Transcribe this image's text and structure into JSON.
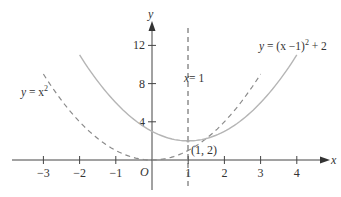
{
  "chart_data": {
    "type": "line",
    "title": "",
    "xlabel": "x",
    "ylabel": "y",
    "xlim": [
      -3.6,
      4.9
    ],
    "ylim": [
      -3,
      16
    ],
    "grid": false,
    "origin_label": "O",
    "x_ticks": [
      -3,
      -2,
      -1,
      1,
      2,
      3,
      4
    ],
    "x_tick_labels": [
      "−3",
      "−2",
      "−1",
      "1",
      "2",
      "3",
      "4"
    ],
    "y_ticks": [
      4,
      8,
      12
    ],
    "y_tick_labels": [
      "4",
      "8",
      "12"
    ],
    "series": [
      {
        "name": "y = x²",
        "style": "dashed",
        "color": "#8a8a8a",
        "x": [
          -3,
          -2,
          -1,
          0,
          1,
          2,
          3
        ],
        "y": [
          9,
          4,
          1,
          0,
          1,
          4,
          9
        ]
      },
      {
        "name": "y = (x − 1)² + 2",
        "style": "solid",
        "color": "#b5b5b5",
        "x": [
          -2,
          -1,
          0,
          1,
          2,
          3,
          4
        ],
        "y": [
          11,
          6,
          3,
          2,
          3,
          6,
          11
        ]
      },
      {
        "name": "x = 1",
        "style": "dashed",
        "color": "#555555",
        "type": "vertical_line",
        "x_value": 1
      }
    ],
    "annotations": [
      {
        "text": "(1, 2)",
        "x": 1,
        "y": 2
      },
      {
        "text": "y = x²",
        "near": "left dashed curve"
      },
      {
        "text": "y = (x −1)² + 2",
        "near": "right solid curve"
      },
      {
        "text": "x = 1",
        "near": "vertical dashed line"
      }
    ]
  },
  "labels": {
    "y_axis": "y",
    "x_axis": "x",
    "origin": "O",
    "point": "(1, 2)",
    "vline": "= 1",
    "vline_var": "x",
    "curve1_prefix": "y",
    "curve1_eq": " = x",
    "curve1_exp": "2",
    "curve2_prefix": "y",
    "curve2_eq": " = (x −1)",
    "curve2_exp": "2",
    "curve2_tail": " + 2"
  }
}
